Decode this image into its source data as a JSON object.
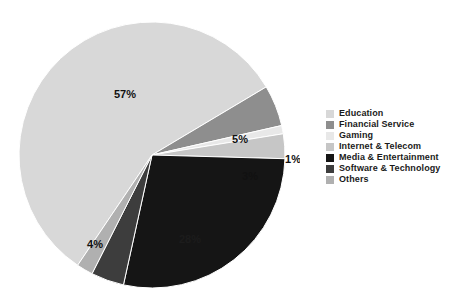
{
  "top_crop_text": "",
  "colors": {
    "education": "#d8d8d8",
    "financial_service": "#8e8e8e",
    "gaming": "#e8e8e8",
    "internet_telecom": "#c6c6c6",
    "media_entertainment": "#151515",
    "software_technology": "#3d3d3d",
    "others": "#b0b0b0",
    "background": "#ffffff",
    "label_text": "#111111"
  },
  "legend": {
    "items": [
      {
        "label": "Education",
        "color": "#d8d8d8"
      },
      {
        "label": "Financial Service",
        "color": "#8e8e8e"
      },
      {
        "label": "Gaming",
        "color": "#e8e8e8"
      },
      {
        "label": "Internet & Telecom",
        "color": "#c6c6c6"
      },
      {
        "label": "Media & Entertainment",
        "color": "#151515"
      },
      {
        "label": "Software & Technology",
        "color": "#3d3d3d"
      },
      {
        "label": "Others",
        "color": "#b0b0b0"
      }
    ]
  },
  "chart_data": {
    "type": "pie",
    "title": "",
    "xlabel": "",
    "ylabel": "",
    "legend_position": "right",
    "grid": false,
    "value_unit": "%",
    "labels": [
      "Education",
      "Financial Service",
      "Gaming",
      "Internet & Telecom",
      "Media & Entertainment",
      "Software & Technology",
      "Others"
    ],
    "values": [
      57,
      5,
      1,
      3,
      28,
      4,
      2
    ],
    "data_labels": [
      "57%",
      "5%",
      "1%",
      "3%",
      "28%",
      "4%",
      ""
    ],
    "colors": [
      "#d8d8d8",
      "#8e8e8e",
      "#e8e8e8",
      "#c6c6c6",
      "#151515",
      "#3d3d3d",
      "#b0b0b0"
    ],
    "slices": [
      {
        "name": "Education",
        "value": 57,
        "display": "57%",
        "color": "#d8d8d8",
        "start_angle": 124,
        "end_angle": 329.2,
        "label_x": 125,
        "label_y": 90
      },
      {
        "name": "Financial Service",
        "value": 5,
        "display": "5%",
        "color": "#8e8e8e",
        "start_angle": 329.2,
        "end_angle": 347.2,
        "label_x": 240,
        "label_y": 135
      },
      {
        "name": "Gaming",
        "value": 1,
        "display": "1%",
        "color": "#e8e8e8",
        "start_angle": 347.2,
        "end_angle": 350.8,
        "label_x": 293,
        "label_y": 155
      },
      {
        "name": "Internet & Telecom",
        "value": 3,
        "display": "3%",
        "color": "#c6c6c6",
        "start_angle": 350.8,
        "end_angle": 361.6,
        "label_x": 250,
        "label_y": 172
      },
      {
        "name": "Media & Entertainment",
        "value": 28,
        "display": "28%",
        "color": "#151515",
        "start_angle": 1.6,
        "end_angle": 102.4,
        "label_x": 190,
        "label_y": 235
      },
      {
        "name": "Software & Technology",
        "value": 4,
        "display": "4%",
        "color": "#3d3d3d",
        "start_angle": 102.4,
        "end_angle": 116.8,
        "label_x": 95,
        "label_y": 240
      },
      {
        "name": "Others",
        "value": 2,
        "display": "",
        "color": "#b0b0b0",
        "start_angle": 116.8,
        "end_angle": 124,
        "label_x": 0,
        "label_y": 0
      }
    ]
  }
}
